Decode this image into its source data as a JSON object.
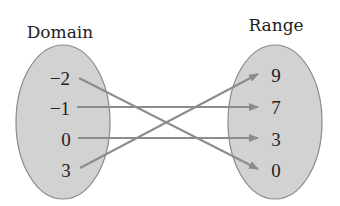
{
  "title_domain": "Domain",
  "title_range": "Range",
  "domain": [
    "−2",
    "−1",
    "0",
    "3"
  ],
  "range": [
    "9",
    "7",
    "3",
    "0"
  ],
  "mappings": [
    {
      "from": "−2",
      "to": "0"
    },
    {
      "from": "−1",
      "to": "7"
    },
    {
      "from": "0",
      "to": "3"
    },
    {
      "from": "3",
      "to": "9"
    }
  ],
  "colors": {
    "ellipse_fill": "#d2d2d2",
    "ellipse_stroke": "#8a8a8a",
    "arrow": "#8c8c8c"
  }
}
